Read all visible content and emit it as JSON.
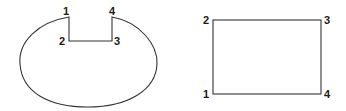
{
  "figures": [
    {
      "name": "notched-oval",
      "labels": [
        {
          "text": "1",
          "x": 66,
          "y": 15
        },
        {
          "text": "2",
          "x": 59,
          "y": 45
        },
        {
          "text": "3",
          "x": 114,
          "y": 45
        },
        {
          "text": "4",
          "x": 109,
          "y": 15
        }
      ]
    },
    {
      "name": "rectangle",
      "labels": [
        {
          "text": "2",
          "x": 204,
          "y": 24
        },
        {
          "text": "3",
          "x": 324,
          "y": 24
        },
        {
          "text": "1",
          "x": 204,
          "y": 98
        },
        {
          "text": "4",
          "x": 324,
          "y": 98
        }
      ]
    }
  ],
  "colors": {
    "stroke": "#333333",
    "text": "#1a1a1a",
    "background": "#ffffff"
  }
}
